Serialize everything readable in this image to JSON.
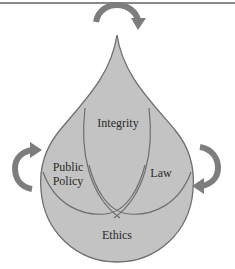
{
  "diagram": {
    "shape": "water-drop",
    "regions": {
      "top": "Integrity",
      "left": "Public Policy",
      "left_line1": "Public",
      "left_line2": "Policy",
      "right": "Law",
      "bottom": "Ethics"
    },
    "arrows": [
      {
        "position": "top",
        "direction": "clockwise"
      },
      {
        "position": "left",
        "direction": "clockwise"
      },
      {
        "position": "right",
        "direction": "clockwise"
      }
    ],
    "colors": {
      "drop_fill": "#c3c3c3",
      "outline": "#6e6e6e",
      "arrow": "#7d7d7d",
      "text": "#2a2a2a"
    }
  }
}
